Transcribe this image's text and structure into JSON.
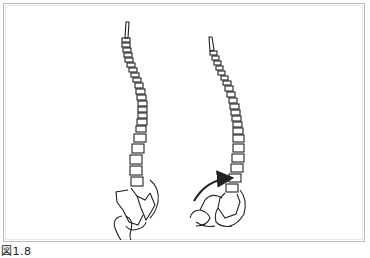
{
  "figure": {
    "caption": "図1.8",
    "panels": [
      {
        "name": "spine-neutral-pelvis",
        "description": "Lateral view of spine with neutral pelvis and femur"
      },
      {
        "name": "spine-tilted-pelvis",
        "description": "Lateral view of spine with pelvis tilted, curved arrow indicating rotation"
      }
    ],
    "arrow_icon": "curved-arrow-icon",
    "colors": {
      "line": "#222222",
      "frame": "#bdbdbd",
      "background": "#ffffff"
    }
  }
}
